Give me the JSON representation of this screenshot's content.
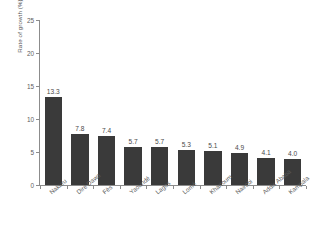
{
  "chart_data": {
    "type": "bar",
    "title": "",
    "subtitle": "",
    "xlabel": "",
    "ylabel": "Rate of growth (%)",
    "ylim": [
      0,
      25
    ],
    "yticks": [
      0,
      5,
      10,
      15,
      20,
      25
    ],
    "ytick_labels": [
      "0",
      "5",
      "10",
      "15",
      "20",
      "25"
    ],
    "grid": false,
    "legend": null,
    "bar_color": "#3a3a3a",
    "axis_color": "#8c8c8c",
    "text_color": "#4a4a4a",
    "background": "#ffffff",
    "categories": [
      "Nakuru",
      "Dire Dawa",
      "Fès",
      "Yaoundé",
      "Lagos",
      "Lomé",
      "Khartoum",
      "Nairobi",
      "Addis Ababa",
      "Kampala"
    ],
    "values": [
      13.3,
      7.8,
      7.4,
      5.7,
      5.7,
      5.3,
      5.1,
      4.9,
      4.1,
      4.0
    ],
    "value_labels": [
      "13.3",
      "7.8",
      "7.4",
      "5.7",
      "5.7",
      "5.3",
      "5.1",
      "4.9",
      "4.1",
      "4.0"
    ]
  }
}
